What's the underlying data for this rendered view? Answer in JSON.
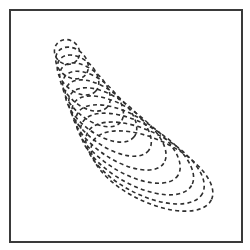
{
  "figure": {
    "frame": {
      "x": 9,
      "y": 9,
      "width": 232,
      "height": 232,
      "stroke": "#3a3a3a"
    },
    "stroke_color": "#2f2f2f",
    "line_style": "dashed",
    "loops": [
      {
        "cx": 67,
        "cy": 52,
        "rx": 13,
        "ry": 12,
        "rotate": 40
      },
      {
        "cx": 72,
        "cy": 63,
        "rx": 18,
        "ry": 14,
        "rotate": 42
      },
      {
        "cx": 78,
        "cy": 75,
        "rx": 24,
        "ry": 16,
        "rotate": 42
      },
      {
        "cx": 85,
        "cy": 87,
        "rx": 30,
        "ry": 18,
        "rotate": 42
      },
      {
        "cx": 93,
        "cy": 99,
        "rx": 36,
        "ry": 20,
        "rotate": 40
      },
      {
        "cx": 101,
        "cy": 111,
        "rx": 42,
        "ry": 22,
        "rotate": 38
      },
      {
        "cx": 110,
        "cy": 122,
        "rx": 48,
        "ry": 24,
        "rotate": 36
      },
      {
        "cx": 119,
        "cy": 133,
        "rx": 54,
        "ry": 26,
        "rotate": 34
      },
      {
        "cx": 128,
        "cy": 144,
        "rx": 59,
        "ry": 28,
        "rotate": 32
      },
      {
        "cx": 137,
        "cy": 154,
        "rx": 63,
        "ry": 30,
        "rotate": 30
      },
      {
        "cx": 145,
        "cy": 163,
        "rx": 65,
        "ry": 31,
        "rotate": 28
      },
      {
        "cx": 152,
        "cy": 171,
        "rx": 66,
        "ry": 31,
        "rotate": 26
      }
    ]
  }
}
